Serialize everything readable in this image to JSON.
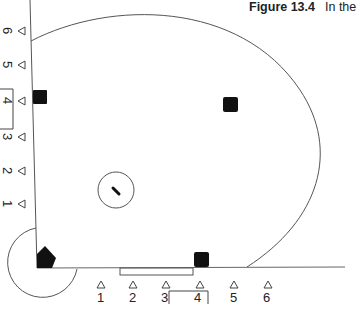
{
  "caption": {
    "figure_label": "Figure 13.4",
    "text": "In the"
  },
  "bottom_positions": {
    "labels": [
      "1",
      "2",
      "3",
      "4",
      "5",
      "6"
    ],
    "bracketed": "4"
  },
  "side_positions": {
    "labels": [
      "6",
      "5",
      "4",
      "3",
      "2",
      "1"
    ],
    "bracketed": "4"
  },
  "markers": {
    "home_plate": "home-plate",
    "pitcher_rubber": "pitcher-rubber",
    "bases": [
      "first-base",
      "second-base",
      "third-base"
    ]
  },
  "colors": {
    "line": "#555555",
    "base": "#111111"
  }
}
